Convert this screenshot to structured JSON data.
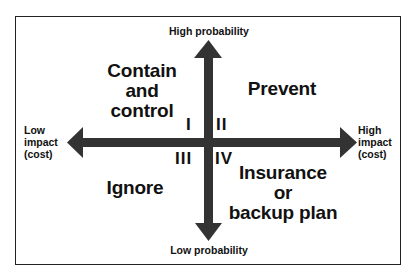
{
  "diagram": {
    "type": "risk-response quadrant",
    "axes": {
      "top": "High probability",
      "bottom": "Low probability",
      "left": [
        "Low",
        "impact",
        "(cost)"
      ],
      "right": [
        "High",
        "impact",
        "(cost)"
      ]
    },
    "quadrants": [
      {
        "numeral": "I",
        "position": "upper-left",
        "strategy": [
          "Contain",
          "and",
          "control"
        ]
      },
      {
        "numeral": "II",
        "position": "upper-right",
        "strategy": [
          "Prevent"
        ]
      },
      {
        "numeral": "III",
        "position": "lower-left",
        "strategy": [
          "Ignore"
        ]
      },
      {
        "numeral": "IV",
        "position": "lower-right",
        "strategy": [
          "Insurance",
          "or",
          "backup plan"
        ]
      }
    ],
    "colors": {
      "arrow": "#333333",
      "text": "#111111",
      "border": "#222222",
      "background": "#ffffff"
    }
  }
}
